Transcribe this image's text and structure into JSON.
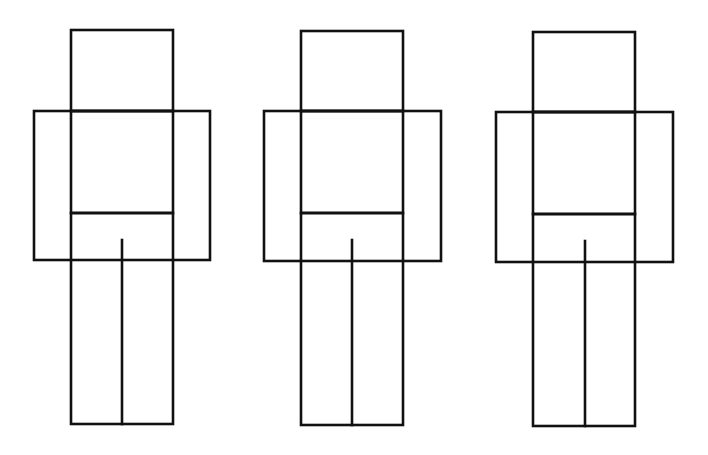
{
  "diagram": {
    "background_color": "#ffffff",
    "stroke_color": "#111111",
    "figures": [
      {
        "id": "figure-1",
        "head": {
          "x1": 71,
          "y1": 30,
          "x2": 173,
          "y2": 111
        },
        "arms": {
          "x1": 34,
          "y1": 111,
          "x2": 210,
          "y2": 260
        },
        "torso": {
          "x1": 71,
          "y1": 111,
          "x2": 173,
          "y2": 213
        },
        "legs": {
          "x1": 71,
          "y1": 213,
          "x2": 173,
          "y2": 424
        },
        "leg_split": {
          "x": 122,
          "y1": 240,
          "y2": 424
        }
      },
      {
        "id": "figure-2",
        "head": {
          "x1": 301,
          "y1": 31,
          "x2": 403,
          "y2": 111
        },
        "arms": {
          "x1": 264,
          "y1": 111,
          "x2": 441,
          "y2": 261
        },
        "torso": {
          "x1": 301,
          "y1": 111,
          "x2": 403,
          "y2": 213
        },
        "legs": {
          "x1": 301,
          "y1": 213,
          "x2": 403,
          "y2": 425
        },
        "leg_split": {
          "x": 352,
          "y1": 240,
          "y2": 425
        }
      },
      {
        "id": "figure-3",
        "head": {
          "x1": 533,
          "y1": 32,
          "x2": 635,
          "y2": 112
        },
        "arms": {
          "x1": 496,
          "y1": 112,
          "x2": 673,
          "y2": 262
        },
        "torso": {
          "x1": 533,
          "y1": 112,
          "x2": 635,
          "y2": 214
        },
        "legs": {
          "x1": 533,
          "y1": 214,
          "x2": 635,
          "y2": 426
        },
        "leg_split": {
          "x": 585,
          "y1": 241,
          "y2": 426
        }
      }
    ]
  }
}
